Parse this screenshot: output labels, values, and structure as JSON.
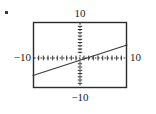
{
  "figure": {
    "kind": "graphing-calculator-viewing-window",
    "corner_mark": "bullet-mark",
    "frame": {
      "stroke_color": "#2b2b2b",
      "fill_color": "#ffffff",
      "left_px": 33,
      "top_px": 22,
      "right_px": 127,
      "bottom_px": 88
    },
    "labels": {
      "top": "10",
      "bottom": "−10",
      "left": "−10",
      "right": "10"
    },
    "axis_color": "#2b2b2b",
    "line_color": "#3a3a3a"
  },
  "chart_data": {
    "type": "line",
    "title": "",
    "subtitle": "",
    "xlabel": "",
    "ylabel": "",
    "xlim": [
      -10,
      10
    ],
    "ylim": [
      -10,
      10
    ],
    "xticks": [
      -10,
      -9,
      -8,
      -7,
      -6,
      -5,
      -4,
      -3,
      -2,
      -1,
      0,
      1,
      2,
      3,
      4,
      5,
      6,
      7,
      8,
      9,
      10
    ],
    "yticks": [
      -10,
      -9,
      -8,
      -7,
      -6,
      -5,
      -4,
      -3,
      -2,
      -1,
      0,
      1,
      2,
      3,
      4,
      5,
      6,
      7,
      8,
      9,
      10
    ],
    "xtick_labels": [
      "−10",
      "10"
    ],
    "ytick_labels": [
      "−10",
      "10"
    ],
    "grid": false,
    "axes_style": "dotted-with-tick-marks",
    "legend": null,
    "legend_position": "none",
    "annotations": [],
    "series": [
      {
        "name": "line",
        "equation": "y = 0.46x - 1.6",
        "slope": 0.46,
        "intercept": -1.6,
        "x_intercept": 3.5,
        "x": [
          -10,
          10
        ],
        "y": [
          -6.2,
          3.0
        ],
        "color": "#3a3a3a",
        "width_px": 1
      }
    ]
  }
}
